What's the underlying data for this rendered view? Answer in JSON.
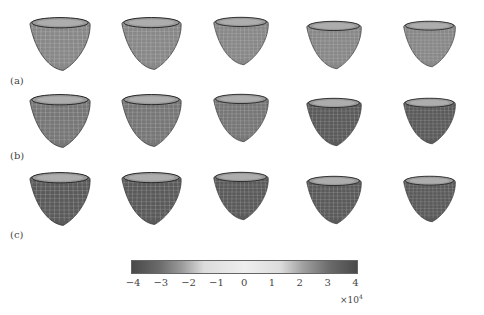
{
  "figure": {
    "rows": [
      {
        "label": "(a)",
        "hearts": 5,
        "shading": "light"
      },
      {
        "label": "(b)",
        "hearts": 5,
        "shading": "medium"
      },
      {
        "label": "(c)",
        "hearts": 5,
        "shading": "dark"
      }
    ],
    "colorbar": {
      "ticks": [
        "−4",
        "−3",
        "−2",
        "−1",
        "0",
        "1",
        "2",
        "3",
        "4"
      ],
      "exponent_prefix": "×10",
      "exponent": "4",
      "colors": {
        "low": "#4a4a4a",
        "mid": "#eeeeee",
        "high": "#4a4a4a"
      }
    }
  }
}
